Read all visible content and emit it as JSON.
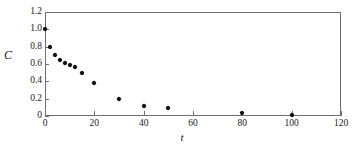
{
  "chart_data": {
    "type": "scatter",
    "title": "",
    "xlabel": "t",
    "ylabel": "C",
    "xlim": [
      0,
      120
    ],
    "ylim": [
      0,
      1.2
    ],
    "grid": false,
    "legend": null,
    "frame": "full-box",
    "marker": "filled-diamond",
    "marker_color": "#111111",
    "axis_color": "#6e6e6e",
    "xticks": [
      0,
      20,
      40,
      60,
      80,
      100,
      120
    ],
    "xtick_labels": [
      "0",
      "20",
      "40",
      "60",
      "80",
      "100",
      "120"
    ],
    "yticks": [
      0,
      0.2,
      0.4,
      0.6,
      0.8,
      1.0,
      1.2
    ],
    "ytick_labels": [
      "0",
      "0.2",
      "0.4",
      "0.6",
      "0.8",
      "1.0",
      "1.2"
    ],
    "x": [
      0,
      2,
      4,
      6,
      8,
      10,
      12,
      15,
      20,
      30,
      40,
      50,
      80,
      100
    ],
    "y": [
      1.0,
      0.8,
      0.7,
      0.65,
      0.61,
      0.59,
      0.57,
      0.5,
      0.385,
      0.195,
      0.115,
      0.09,
      0.035,
      0.01
    ],
    "points": [
      {
        "x": 0,
        "y": 1.0
      },
      {
        "x": 2,
        "y": 0.8
      },
      {
        "x": 4,
        "y": 0.7
      },
      {
        "x": 6,
        "y": 0.65
      },
      {
        "x": 8,
        "y": 0.61
      },
      {
        "x": 10,
        "y": 0.59
      },
      {
        "x": 12,
        "y": 0.57
      },
      {
        "x": 15,
        "y": 0.5
      },
      {
        "x": 20,
        "y": 0.385
      },
      {
        "x": 30,
        "y": 0.195
      },
      {
        "x": 40,
        "y": 0.115
      },
      {
        "x": 50,
        "y": 0.09
      },
      {
        "x": 80,
        "y": 0.035
      },
      {
        "x": 100,
        "y": 0.01
      }
    ]
  }
}
